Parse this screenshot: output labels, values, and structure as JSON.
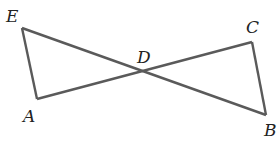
{
  "diagram": {
    "type": "geometry",
    "points": {
      "E": {
        "label": "E",
        "x": 22,
        "y": 28
      },
      "A": {
        "label": "A",
        "x": 37,
        "y": 99
      },
      "D": {
        "label": "D",
        "x": 143,
        "y": 70
      },
      "C": {
        "label": "C",
        "x": 252,
        "y": 42
      },
      "B": {
        "label": "B",
        "x": 266,
        "y": 115
      }
    },
    "segments": [
      "EA",
      "EB",
      "AC",
      "CB"
    ],
    "intersection": "D",
    "labels": {
      "E": "E",
      "A": "A",
      "D": "D",
      "C": "C",
      "B": "B"
    }
  }
}
